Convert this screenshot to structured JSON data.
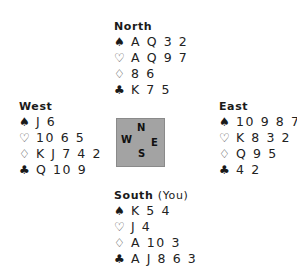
{
  "hands": {
    "north": {
      "label": "North",
      "suits": {
        "spades": {
          "icon": "♠",
          "cards": "A Q 3 2"
        },
        "hearts": {
          "icon": "♡",
          "cards": "A Q 9 7"
        },
        "diamonds": {
          "icon": "♢",
          "cards": "8 6"
        },
        "clubs": {
          "icon": "♣",
          "cards": "K 7 5"
        }
      }
    },
    "west": {
      "label": "West",
      "suits": {
        "spades": {
          "icon": "♠",
          "cards": "J 6"
        },
        "hearts": {
          "icon": "♡",
          "cards": "10 6 5"
        },
        "diamonds": {
          "icon": "♢",
          "cards": "K J 7 4 2"
        },
        "clubs": {
          "icon": "♣",
          "cards": "Q 10 9"
        }
      }
    },
    "east": {
      "label": "East",
      "suits": {
        "spades": {
          "icon": "♠",
          "cards": "10 9 8 7"
        },
        "hearts": {
          "icon": "♡",
          "cards": "K 8 3 2"
        },
        "diamonds": {
          "icon": "♢",
          "cards": "Q 9 5"
        },
        "clubs": {
          "icon": "♣",
          "cards": "4 2"
        }
      }
    },
    "south": {
      "label": "South",
      "label_suffix": "(You)",
      "suits": {
        "spades": {
          "icon": "♠",
          "cards": "K 5 4"
        },
        "hearts": {
          "icon": "♡",
          "cards": "J 4"
        },
        "diamonds": {
          "icon": "♢",
          "cards": "A 10 3"
        },
        "clubs": {
          "icon": "♣",
          "cards": "A J 8 6 3"
        }
      }
    }
  },
  "compass": {
    "n": "N",
    "w": "W",
    "e": "E",
    "s": "S"
  },
  "colors": {
    "compass_bg": "#a3a3a3",
    "compass_border": "#8a8a8a",
    "text": "#222222"
  }
}
